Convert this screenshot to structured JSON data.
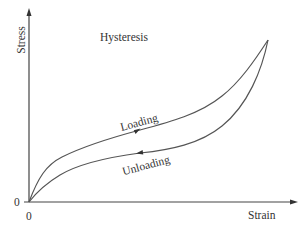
{
  "diagram": {
    "title": "Hysteresis",
    "y_axis_label": "Stress",
    "x_axis_label": "Strain",
    "x_origin_label": "0",
    "y_origin_label": "0",
    "curves": [
      {
        "name": "loading",
        "label": "Loading",
        "direction": "forward (origin to peak)"
      },
      {
        "name": "unloading",
        "label": "Unloading",
        "direction": "backward (peak to origin)"
      }
    ],
    "colors": {
      "line": "#555555",
      "axis": "#444444",
      "text": "#333333"
    }
  }
}
